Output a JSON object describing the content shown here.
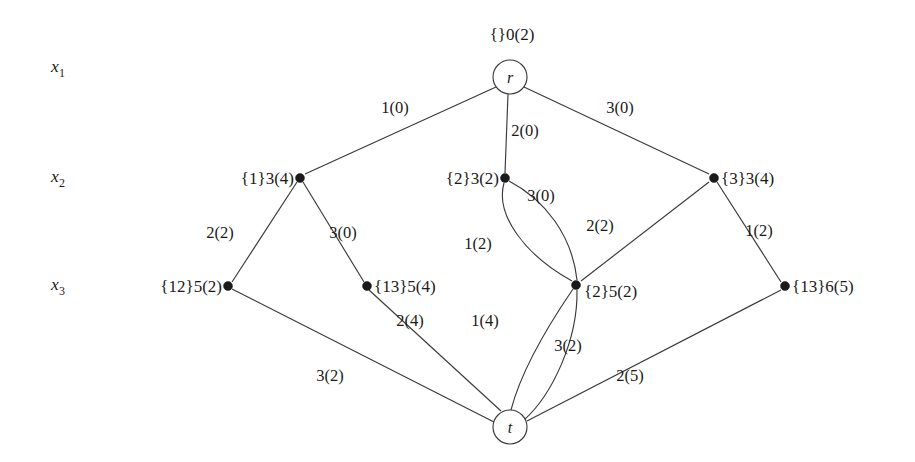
{
  "figure": {
    "width": 915,
    "height": 462,
    "background_color": "#ffffff",
    "line_color": "#3a3a3a",
    "text_color": "#1a1a1a"
  },
  "row_labels": [
    {
      "name": "x",
      "subscript": "1",
      "x": 58,
      "y": 72
    },
    {
      "name": "x",
      "subscript": "2",
      "x": 58,
      "y": 182
    },
    {
      "name": "x",
      "subscript": "3",
      "x": 58,
      "y": 290
    }
  ],
  "nodes": [
    {
      "id": "r",
      "kind": "circle",
      "circle_label": "r",
      "caption": "{}0(2)",
      "caption_anchor": "middle",
      "caption_x": 512,
      "caption_y": 40,
      "x": 510,
      "y": 77,
      "r": 17
    },
    {
      "id": "n1",
      "kind": "dot",
      "caption": "{1}3(4)",
      "caption_anchor": "end",
      "caption_x": 294,
      "caption_y": 184,
      "x": 300,
      "y": 178,
      "r": 4.5
    },
    {
      "id": "n2",
      "kind": "dot",
      "caption": "{2}3(2)",
      "caption_anchor": "end",
      "caption_x": 499,
      "caption_y": 184,
      "x": 505,
      "y": 178,
      "r": 4.5
    },
    {
      "id": "n3",
      "kind": "dot",
      "caption": "{3}3(4)",
      "caption_anchor": "start",
      "caption_x": 721,
      "caption_y": 184,
      "x": 714,
      "y": 178,
      "r": 4.5
    },
    {
      "id": "n12",
      "kind": "dot",
      "caption": "{12}5(2)",
      "caption_anchor": "end",
      "caption_x": 222,
      "caption_y": 292,
      "x": 228,
      "y": 286,
      "r": 4.5
    },
    {
      "id": "n13a",
      "kind": "dot",
      "caption": "{13}5(4)",
      "caption_anchor": "start",
      "caption_x": 374,
      "caption_y": 292,
      "x": 367,
      "y": 286,
      "r": 4.5
    },
    {
      "id": "n2b",
      "kind": "dot",
      "caption": "{2}5(2)",
      "caption_anchor": "start",
      "caption_x": 584,
      "caption_y": 297,
      "x": 576,
      "y": 285,
      "r": 4.5
    },
    {
      "id": "n13b",
      "kind": "dot",
      "caption": "{13}6(5)",
      "caption_anchor": "start",
      "caption_x": 792,
      "caption_y": 292,
      "x": 785,
      "y": 286,
      "r": 4.5
    },
    {
      "id": "t",
      "kind": "circle",
      "circle_label": "t",
      "caption": "",
      "caption_anchor": "middle",
      "caption_x": 510,
      "caption_y": 462,
      "x": 510,
      "y": 427,
      "r": 17
    }
  ],
  "edges": [
    {
      "id": "e-r-n1",
      "from": "r",
      "to": "n1",
      "path": "M 496 87 L 305 174",
      "weight": "1(0)",
      "label_x": 395,
      "label_y": 113
    },
    {
      "id": "e-r-n2",
      "from": "r",
      "to": "n2",
      "path": "M 508 94 L 505 173",
      "weight": "2(0)",
      "label_x": 525,
      "label_y": 136
    },
    {
      "id": "e-r-n3",
      "from": "r",
      "to": "n3",
      "path": "M 524 87 L 709 174",
      "weight": "3(0)",
      "label_x": 620,
      "label_y": 113
    },
    {
      "id": "e-n1-n12",
      "from": "n1",
      "to": "n12",
      "path": "M 297 182 L 232 282",
      "weight": "2(2)",
      "label_x": 220,
      "label_y": 238
    },
    {
      "id": "e-n1-n13a",
      "from": "n1",
      "to": "n13a",
      "path": "M 303 182 L 364 282",
      "weight": "3(0)",
      "label_x": 343,
      "label_y": 238
    },
    {
      "id": "e-n2-n2b-left",
      "from": "n2",
      "to": "n2b",
      "path": "M 504 183 C 495 215 525 255 572 281",
      "weight": "1(2)",
      "label_x": 478,
      "label_y": 249
    },
    {
      "id": "e-n2-n2b-right",
      "from": "n2",
      "to": "n2b",
      "path": "M 509 181 C 545 200 572 235 577 280",
      "weight": "3(0)",
      "label_x": 541,
      "label_y": 201
    },
    {
      "id": "e-n3-n2b",
      "from": "n3",
      "to": "n2b",
      "path": "M 709 182 L 581 281",
      "weight": "2(2)",
      "label_x": 600,
      "label_y": 231
    },
    {
      "id": "e-n3-n13b",
      "from": "n3",
      "to": "n13b",
      "path": "M 717 182 L 781 282",
      "weight": "1(2)",
      "label_x": 759,
      "label_y": 236
    },
    {
      "id": "e-n12-t",
      "from": "n12",
      "to": "t",
      "path": "M 232 289 L 494 422",
      "weight": "3(2)",
      "label_x": 330,
      "label_y": 381
    },
    {
      "id": "e-n13a-t",
      "from": "n13a",
      "to": "t",
      "path": "M 369 290 L 501 411",
      "weight": "2(4)",
      "label_x": 410,
      "label_y": 326
    },
    {
      "id": "e-n2b-t-left",
      "from": "n2b",
      "to": "t",
      "path": "M 573 289 C 545 330 520 375 511 410",
      "weight": "1(4)",
      "label_x": 485,
      "label_y": 326
    },
    {
      "id": "e-n2b-t-right",
      "from": "n2b",
      "to": "t",
      "path": "M 577 290 C 578 340 552 395 524 420",
      "weight": "3(2)",
      "label_x": 568,
      "label_y": 351
    },
    {
      "id": "e-n13b-t",
      "from": "n13b",
      "to": "t",
      "path": "M 781 290 L 527 421",
      "weight": "2(5)",
      "label_x": 630,
      "label_y": 381
    }
  ]
}
